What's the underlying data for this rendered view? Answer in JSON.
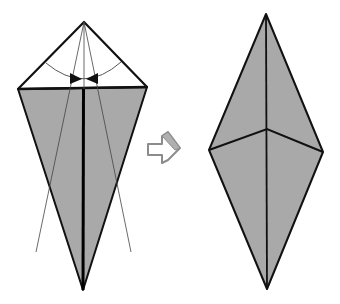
{
  "diagram": {
    "type": "origami-fold-step",
    "colors": {
      "paper_back": "#a9a9a9",
      "paper_front": "#ffffff",
      "outline": "#111111",
      "crease": "#555555",
      "arrow_outline": "#8c8c8c"
    },
    "steps": [
      {
        "id": "before",
        "description": "Kite base with top flap white; fold the upper edges down to meet centre line"
      },
      {
        "id": "after",
        "description": "Resulting diamond shape, all grey"
      }
    ],
    "arrow": {
      "icon": "next-step-arrow-icon",
      "direction": "right"
    }
  }
}
